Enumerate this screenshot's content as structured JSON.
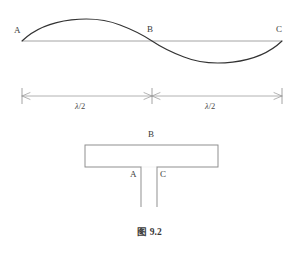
{
  "figure": {
    "caption": "图 9.2",
    "caption_prefix": "图",
    "caption_number": "9.2",
    "background_color": "#ffffff",
    "ink_color": "#3a3a3a",
    "thin_line_color": "#999999"
  },
  "wave_diagram": {
    "name": "standing-wave-half-wavelengths",
    "axis_label": "",
    "points": [
      {
        "id": "A",
        "label": "A",
        "x": 22,
        "y": 41
      },
      {
        "id": "B",
        "label": "B",
        "x": 152,
        "y": 41
      },
      {
        "id": "C",
        "label": "C",
        "x": 282,
        "y": 41
      }
    ],
    "baseline_y": 41,
    "crest_y": 22,
    "trough_y": 60,
    "curve_color": "#333333",
    "baseline_color": "#999999"
  },
  "dimension_line": {
    "name": "wavelength-dimension-line",
    "y": 96,
    "ticks": [
      22,
      152,
      282
    ],
    "segments": [
      {
        "label_prefix": "λ",
        "label_suffix": "/2",
        "label": "λ/2",
        "from": 22,
        "to": 152,
        "center": 83
      },
      {
        "label_prefix": "λ",
        "label_suffix": "/2",
        "label": "λ/2",
        "from": 152,
        "to": 282,
        "center": 213
      }
    ],
    "line_color": "#999999"
  },
  "tube_diagram": {
    "name": "t-shaped-resonance-tube",
    "body": {
      "x": 85,
      "y": 145,
      "width": 133,
      "height": 22
    },
    "stems": [
      {
        "id": "A",
        "x": 141,
        "top": 167,
        "bottom": 207
      },
      {
        "id": "C",
        "x": 157,
        "top": 167,
        "bottom": 207
      }
    ],
    "labels": [
      {
        "id": "B",
        "label": "B",
        "x": 149,
        "y": 131
      },
      {
        "id": "A",
        "label": "A",
        "x": 131,
        "y": 172
      },
      {
        "id": "C",
        "label": "C",
        "x": 161,
        "y": 172
      }
    ],
    "outline_color": "#8a8a8a"
  }
}
